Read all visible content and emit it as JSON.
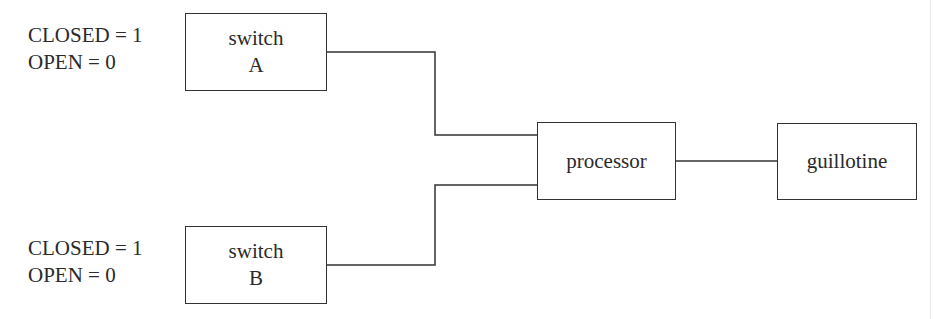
{
  "diagram": {
    "switch_a": {
      "line1": "switch",
      "line2": "A",
      "legend": {
        "closed": "CLOSED = 1",
        "open": "OPEN = 0"
      }
    },
    "switch_b": {
      "line1": "switch",
      "line2": "B",
      "legend": {
        "closed": "CLOSED = 1",
        "open": "OPEN = 0"
      }
    },
    "processor": {
      "label": "processor"
    },
    "guillotine": {
      "label": "guillotine"
    },
    "connections": [
      {
        "from": "switch A",
        "to": "processor"
      },
      {
        "from": "switch B",
        "to": "processor"
      },
      {
        "from": "processor",
        "to": "guillotine"
      }
    ],
    "colors": {
      "line": "#333333",
      "text": "#2a2a2a",
      "background": "#ffffff"
    }
  }
}
